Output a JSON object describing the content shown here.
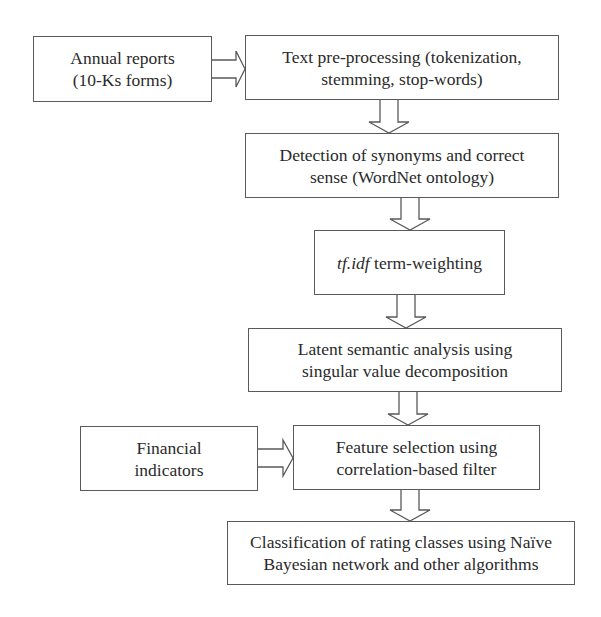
{
  "diagram": {
    "type": "flowchart",
    "nodes": {
      "annual_reports": {
        "lines": [
          "Annual reports",
          "(10-Ks forms)"
        ]
      },
      "text_preprocessing": {
        "lines": [
          "Text pre-processing (tokenization,",
          "stemming, stop-words)"
        ]
      },
      "synonym_detection": {
        "lines": [
          "Detection of synonyms and correct",
          "sense (WordNet ontology)"
        ]
      },
      "tfidf": {
        "italic_part": "tf.idf",
        "rest": " term-weighting"
      },
      "lsa": {
        "lines": [
          "Latent semantic analysis using",
          "singular value decomposition"
        ]
      },
      "financial_indicators": {
        "lines": [
          "Financial",
          "indicators"
        ]
      },
      "feature_selection": {
        "lines": [
          "Feature selection using",
          "correlation-based filter"
        ]
      },
      "classification": {
        "lines": [
          "Classification of rating classes using Naïve",
          "Bayesian network and other algorithms"
        ]
      }
    },
    "edges": [
      {
        "from": "annual_reports",
        "to": "text_preprocessing",
        "style": "hollow-arrow-right"
      },
      {
        "from": "text_preprocessing",
        "to": "synonym_detection",
        "style": "hollow-arrow-down"
      },
      {
        "from": "synonym_detection",
        "to": "tfidf",
        "style": "hollow-arrow-down"
      },
      {
        "from": "tfidf",
        "to": "lsa",
        "style": "hollow-arrow-down"
      },
      {
        "from": "lsa",
        "to": "feature_selection",
        "style": "hollow-arrow-down"
      },
      {
        "from": "financial_indicators",
        "to": "feature_selection",
        "style": "hollow-arrow-right"
      },
      {
        "from": "feature_selection",
        "to": "classification",
        "style": "hollow-arrow-down"
      }
    ],
    "colors": {
      "stroke": "#5a5a5a",
      "text": "#2a2a2a",
      "background": "#ffffff"
    }
  }
}
